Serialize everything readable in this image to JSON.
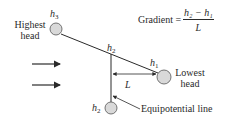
{
  "diagram": {
    "nodes": {
      "highest": {
        "symbol": "h",
        "subscript": "3",
        "label_line1": "Highest",
        "label_line2": "head"
      },
      "middle": {
        "symbol": "h",
        "subscript": "2"
      },
      "lowest": {
        "symbol": "h",
        "subscript": "1",
        "label_line1": "Lowest",
        "label_line2": "head"
      },
      "bottom": {
        "symbol": "h",
        "subscript": "2"
      }
    },
    "dimension_label": "L",
    "equipotential_label": "Equipotential line",
    "formula": {
      "lhs": "Gradient =",
      "numerator": "h₂ − h₁",
      "denominator": "L"
    },
    "flow_arrows": 2,
    "colors": {
      "line": "#2a2a2a",
      "circle_fill": "#d9d9d9",
      "circle_stroke": "#555555"
    }
  }
}
